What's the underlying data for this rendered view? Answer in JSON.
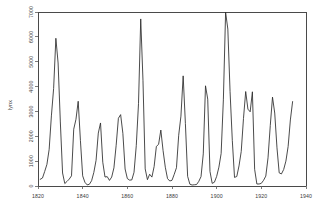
{
  "chart_data": {
    "type": "line",
    "title": "",
    "subtitle": "",
    "xlabel": "",
    "ylabel": "lynx",
    "xlim": [
      1820,
      1940
    ],
    "ylim": [
      0,
      7000
    ],
    "grid": false,
    "legend": false,
    "legend_position": "none",
    "line_color": "#2b2b2b",
    "axis_color": "#4a4a4a",
    "background_color": "#ffffff",
    "xticks": [
      1820,
      1840,
      1860,
      1880,
      1900,
      1920,
      1940
    ],
    "xtick_labels": [
      "1820",
      "1840",
      "1860",
      "1880",
      "1900",
      "1920",
      "1940"
    ],
    "yticks": [
      0,
      1000,
      2000,
      3000,
      4000,
      5000,
      6000,
      7000
    ],
    "ytick_labels": [
      "0",
      "1000",
      "2000",
      "3000",
      "4000",
      "5000",
      "6000",
      "7000"
    ],
    "ytick_labels_rotated": true,
    "xtick_labels_rotated": false,
    "series": [
      {
        "name": "lynx",
        "x": [
          1821,
          1822,
          1823,
          1824,
          1825,
          1826,
          1827,
          1828,
          1829,
          1830,
          1831,
          1832,
          1833,
          1834,
          1835,
          1836,
          1837,
          1838,
          1839,
          1840,
          1841,
          1842,
          1843,
          1844,
          1845,
          1846,
          1847,
          1848,
          1849,
          1850,
          1851,
          1852,
          1853,
          1854,
          1855,
          1856,
          1857,
          1858,
          1859,
          1860,
          1861,
          1862,
          1863,
          1864,
          1865,
          1866,
          1867,
          1868,
          1869,
          1870,
          1871,
          1872,
          1873,
          1874,
          1875,
          1876,
          1877,
          1878,
          1879,
          1880,
          1881,
          1882,
          1883,
          1884,
          1885,
          1886,
          1887,
          1888,
          1889,
          1890,
          1891,
          1892,
          1893,
          1894,
          1895,
          1896,
          1897,
          1898,
          1899,
          1900,
          1901,
          1902,
          1903,
          1904,
          1905,
          1906,
          1907,
          1908,
          1909,
          1910,
          1911,
          1912,
          1913,
          1914,
          1915,
          1916,
          1917,
          1918,
          1919,
          1920,
          1921,
          1922,
          1923,
          1924,
          1925,
          1926,
          1927,
          1928,
          1929,
          1930,
          1931,
          1932,
          1933,
          1934
        ],
        "values": [
          269,
          321,
          585,
          871,
          1475,
          2821,
          3928,
          5943,
          4950,
          2577,
          523,
          98,
          184,
          279,
          409,
          2285,
          2685,
          3409,
          1824,
          409,
          151,
          45,
          68,
          213,
          546,
          1033,
          2129,
          2536,
          957,
          361,
          377,
          225,
          360,
          731,
          1638,
          2725,
          2871,
          2119,
          684,
          299,
          236,
          245,
          552,
          1623,
          3311,
          6721,
          4254,
          687,
          255,
          473,
          358,
          784,
          1594,
          1676,
          2251,
          1426,
          756,
          299,
          201,
          229,
          469,
          736,
          2042,
          2811,
          4431,
          2511,
          389,
          73,
          39,
          49,
          59,
          188,
          377,
          1292,
          4031,
          3495,
          587,
          105,
          153,
          387,
          758,
          1307,
          3465,
          6991,
          6313,
          3794,
          1836,
          345,
          382,
          808,
          1388,
          2713,
          3800,
          3091,
          2985,
          3790,
          674,
          81,
          80,
          108,
          229,
          399,
          1132,
          2432,
          3574,
          2935,
          1537,
          529,
          485,
          662,
          1000,
          1590,
          2657,
          3396
        ]
      }
    ]
  },
  "axis": {
    "ylabel": "lynx"
  }
}
